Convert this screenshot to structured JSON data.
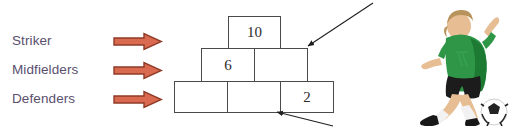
{
  "diagram": {
    "background_color": "#ffffff"
  },
  "labels": {
    "text_color": "#5a4f6e",
    "items": [
      {
        "name": "striker",
        "label": "Striker",
        "top": 29
      },
      {
        "name": "midfielders",
        "label": "Midfielders",
        "top": 58
      },
      {
        "name": "defenders",
        "label": "Defenders",
        "top": 87
      }
    ]
  },
  "block_arrows": {
    "fill_color": "#d9694f",
    "stroke_color": "#8f3b28",
    "items": [
      {
        "name": "arrow-to-striker-row",
        "left": 113,
        "top": 30
      },
      {
        "name": "arrow-to-midfielders-row",
        "left": 113,
        "top": 59
      },
      {
        "name": "arrow-to-defenders-row",
        "left": 113,
        "top": 88
      }
    ]
  },
  "pyramid": {
    "type": "number-pyramid",
    "border_color": "#4a4a4a",
    "cell_fill": "#ffffff",
    "rows": [
      {
        "name": "top-row",
        "role": "Striker",
        "cells": [
          {
            "name": "cell-top-1",
            "value": "10",
            "left": 228,
            "top": 16,
            "width": 53,
            "height": 33
          }
        ]
      },
      {
        "name": "middle-row",
        "role": "Midfielders",
        "cells": [
          {
            "name": "cell-mid-1",
            "value": "6",
            "left": 201,
            "top": 48,
            "width": 54,
            "height": 34
          },
          {
            "name": "cell-mid-2",
            "value": "",
            "left": 254,
            "top": 48,
            "width": 54,
            "height": 34
          }
        ]
      },
      {
        "name": "bottom-row",
        "role": "Defenders",
        "cells": [
          {
            "name": "cell-bot-1",
            "value": "",
            "left": 174,
            "top": 81,
            "width": 54,
            "height": 32
          },
          {
            "name": "cell-bot-2",
            "value": "",
            "left": 227,
            "top": 81,
            "width": 54,
            "height": 32
          },
          {
            "name": "cell-bot-3",
            "value": "2",
            "left": 280,
            "top": 81,
            "width": 54,
            "height": 32
          }
        ]
      }
    ]
  },
  "annotations": {
    "line_color": "#1f1f1f",
    "arrows": [
      {
        "name": "pointer-to-middle-right-cell",
        "x1": 373,
        "y1": 3,
        "x2": 307,
        "y2": 47,
        "target": "cell-mid-2"
      },
      {
        "name": "pointer-to-bottom-middle-cell",
        "x1": 333,
        "y1": 126,
        "x2": 276,
        "y2": 112,
        "target": "cell-bot-2"
      }
    ]
  },
  "player": {
    "name": "soccer-player-photo",
    "description": "Child football player kicking a ball",
    "jersey_color": "#2e9646",
    "jersey_shade": "#1d7a33",
    "shorts_color": "#1c1c1c",
    "skin_color": "#e7bd93",
    "hair_color": "#b9935c",
    "sock_color": "#f2f2f2",
    "boot_color": "#181818",
    "ball_color": "#ffffff",
    "ball_patch_color": "#232323"
  }
}
